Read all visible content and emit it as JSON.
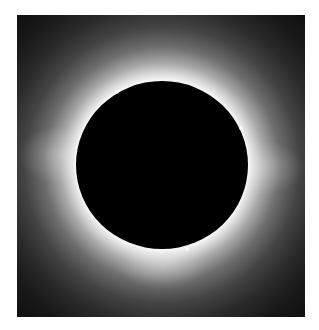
{
  "image": {
    "subject": "total solar eclipse with corona",
    "colors": {
      "background": "#ffffff",
      "sky": "#0c0c0c",
      "corona": "#f0f0f0",
      "moon_disk": "#000000"
    }
  }
}
